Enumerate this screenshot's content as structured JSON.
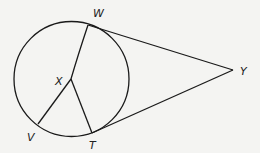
{
  "diagram": {
    "type": "geometry",
    "circle": {
      "cx": 71.5,
      "cy": 79,
      "r": 57.5
    },
    "points": {
      "W": {
        "label": "W",
        "x": 88,
        "y": 25,
        "lx": 93,
        "ly": 17
      },
      "X": {
        "label": "X",
        "x": 71,
        "y": 79,
        "lx": 55,
        "ly": 85
      },
      "V": {
        "label": "V",
        "x": 38,
        "y": 124,
        "lx": 27,
        "ly": 141
      },
      "T": {
        "label": "T",
        "x": 92,
        "y": 133,
        "lx": 89,
        "ly": 149
      },
      "Y": {
        "label": "Y",
        "x": 233,
        "y": 70,
        "lx": 240,
        "ly": 75
      }
    },
    "segments": [
      "WX",
      "XV",
      "XT",
      "WY",
      "TY"
    ],
    "colors": {
      "stroke": "#1a1a1a",
      "background": "#f4f4f2"
    }
  }
}
